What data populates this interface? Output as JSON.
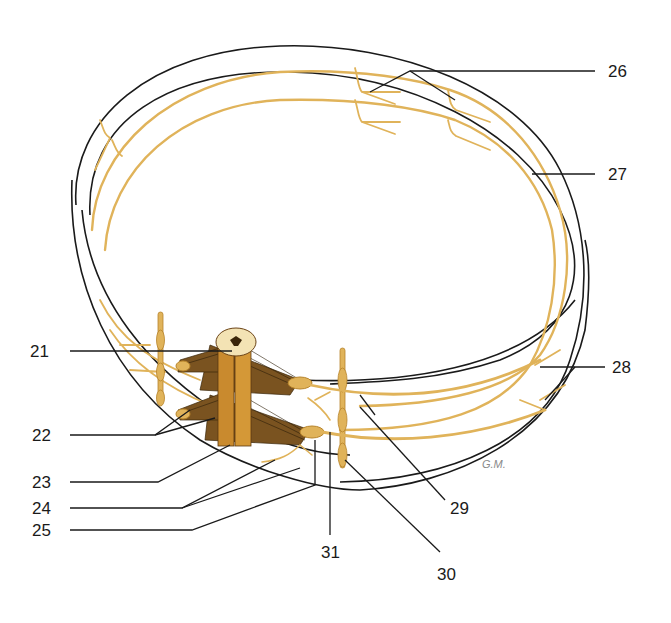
{
  "diagram": {
    "colors": {
      "nerve": "#e0b35a",
      "nerve_dark": "#b7842b",
      "cord": "#c98a2e",
      "cord_dark": "#6b4316",
      "outline": "#1a1a1a",
      "label": "#1a1a1a",
      "background": "#ffffff"
    },
    "signature": "G.M.",
    "labels": [
      {
        "id": "21",
        "text": "21",
        "x": 30,
        "y": 343
      },
      {
        "id": "22",
        "text": "22",
        "x": 32,
        "y": 427
      },
      {
        "id": "23",
        "text": "23",
        "x": 32,
        "y": 475
      },
      {
        "id": "24",
        "text": "24",
        "x": 32,
        "y": 501
      },
      {
        "id": "25",
        "text": "25",
        "x": 32,
        "y": 523
      },
      {
        "id": "26",
        "text": "26",
        "x": 610,
        "y": 63
      },
      {
        "id": "27",
        "text": "27",
        "x": 610,
        "y": 165
      },
      {
        "id": "28",
        "text": "28",
        "x": 614,
        "y": 359
      },
      {
        "id": "29",
        "text": "29",
        "x": 450,
        "y": 500
      },
      {
        "id": "30",
        "text": "30",
        "x": 437,
        "y": 567
      },
      {
        "id": "31",
        "text": "31",
        "x": 321,
        "y": 546
      }
    ]
  }
}
